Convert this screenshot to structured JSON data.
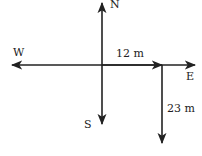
{
  "diagram": {
    "directions": {
      "north": "N",
      "south": "S",
      "east": "E",
      "west": "W"
    },
    "segments": [
      {
        "label": "12 m",
        "direction": "east"
      },
      {
        "label": "23 m",
        "direction": "south"
      }
    ],
    "colors": {
      "line": "#222222",
      "background": "#ffffff"
    }
  }
}
